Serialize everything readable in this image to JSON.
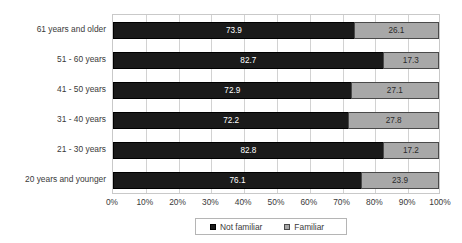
{
  "chart_data": {
    "type": "bar",
    "subtype": "stacked-horizontal-100pct",
    "title": "",
    "xlabel": "",
    "ylabel": "",
    "orientation": "horizontal",
    "stacked": true,
    "grid": true,
    "legend_position": "bottom",
    "xlim": [
      0,
      100
    ],
    "categories": [
      "20 years and younger",
      "21 - 30 years",
      "31 - 40 years",
      "41 - 50 years",
      "51 - 60 years",
      "61 years and older"
    ],
    "series": [
      {
        "name": "Not familiar",
        "color": "#1a1a1a",
        "values": [
          76.1,
          82.8,
          72.2,
          72.9,
          82.7,
          73.9
        ]
      },
      {
        "name": "Familiar",
        "color": "#a8a8a8",
        "values": [
          23.9,
          17.2,
          27.8,
          27.1,
          17.3,
          26.1
        ]
      }
    ],
    "tick_labels": [
      "0%",
      "10%",
      "20%",
      "30%",
      "40%",
      "50%",
      "60%",
      "70%",
      "80%",
      "90%",
      "100%"
    ],
    "tick_values": [
      0,
      10,
      20,
      30,
      40,
      50,
      60,
      70,
      80,
      90,
      100
    ],
    "data_labels": [
      {
        "category": "61 years and older",
        "not_familiar": "73.9",
        "familiar": "26.1"
      },
      {
        "category": "51 - 60 years",
        "not_familiar": "82.7",
        "familiar": "17.3"
      },
      {
        "category": "41 - 50 years",
        "not_familiar": "72.9",
        "familiar": "27.1"
      },
      {
        "category": "31 - 40 years",
        "not_familiar": "72.2",
        "familiar": "27.8"
      },
      {
        "category": "21 - 30 years",
        "not_familiar": "82.8",
        "familiar": "17.2"
      },
      {
        "category": "20 years and younger",
        "not_familiar": "76.1",
        "familiar": "23.9"
      }
    ]
  },
  "legend": {
    "items": [
      {
        "label": "Not familiar",
        "color": "#1a1a1a"
      },
      {
        "label": "Familiar",
        "color": "#a8a8a8"
      }
    ]
  }
}
